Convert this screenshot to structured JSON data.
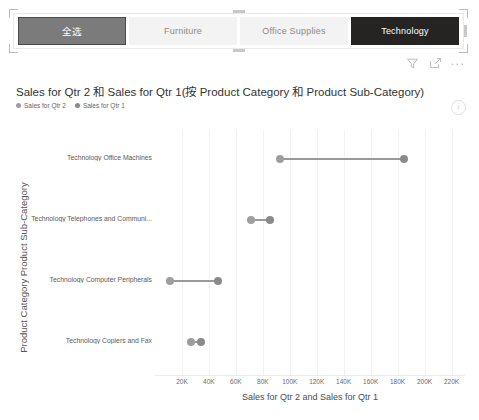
{
  "slicer": {
    "name": "product-category-slicer",
    "items": [
      {
        "label": "全选",
        "state": "all"
      },
      {
        "label": "Furniture",
        "state": "normal"
      },
      {
        "label": "Office Supplies",
        "state": "normal"
      },
      {
        "label": "Technology",
        "state": "selected"
      }
    ]
  },
  "visual_header": {
    "filter_icon": "filter-icon",
    "focus_icon": "focus-mode-icon",
    "more_icon": "more-options-icon",
    "more_label": "..."
  },
  "chart_visual": {
    "info_icon_label": "i"
  },
  "chart_data": {
    "type": "scatter",
    "subtype": "dumbbell",
    "title": "Sales for Qtr 2 和 Sales for Qtr 1(按 Product Category 和 Product Sub-Category)",
    "xlabel": "Sales for Qtr 2 and Sales for Qtr 1",
    "ylabel": "Product Category Product Sub-Category",
    "xlim": [
      0,
      230000
    ],
    "xticks": [
      20000,
      40000,
      60000,
      80000,
      100000,
      120000,
      140000,
      160000,
      180000,
      200000,
      220000
    ],
    "xticklabels": [
      "20K",
      "40K",
      "60K",
      "80K",
      "100K",
      "120K",
      "140K",
      "160K",
      "180K",
      "200K",
      "220K"
    ],
    "grid": true,
    "grid_axis": "x",
    "legend_position": "top-left",
    "series": [
      {
        "name": "Sales for Qtr 2",
        "color": "#9e9e9e",
        "values": [
          93000,
          71000,
          11000,
          27000
        ]
      },
      {
        "name": "Sales for Qtr 1",
        "color": "#8a8a8a",
        "values": [
          185000,
          85000,
          47000,
          34000
        ]
      }
    ],
    "categories": [
      "Technology Office Machines",
      "Technology Telephones and Communi...",
      "Technology Computer Peripherals",
      "Technology Copiers and Fax"
    ]
  }
}
